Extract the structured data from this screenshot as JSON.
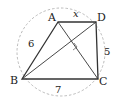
{
  "diagram": {
    "points": {
      "A": {
        "label": "A",
        "x": 58,
        "y": 22
      },
      "B": {
        "label": "B",
        "x": 22,
        "y": 79
      },
      "C": {
        "label": "C",
        "x": 98,
        "y": 79
      },
      "D": {
        "label": "D",
        "x": 96,
        "y": 22
      }
    },
    "edge_labels": {
      "AB": "6",
      "BC": "7",
      "CD": "5",
      "AD": "x"
    },
    "circle": {
      "cx": 61,
      "cy": 52,
      "r": 45,
      "style": "dashed"
    },
    "right_angle_marker": "diagonals AC ⊥ BD",
    "colors": {
      "line": "#333333",
      "circle": "#aaaaaa",
      "text": "#222222"
    }
  }
}
